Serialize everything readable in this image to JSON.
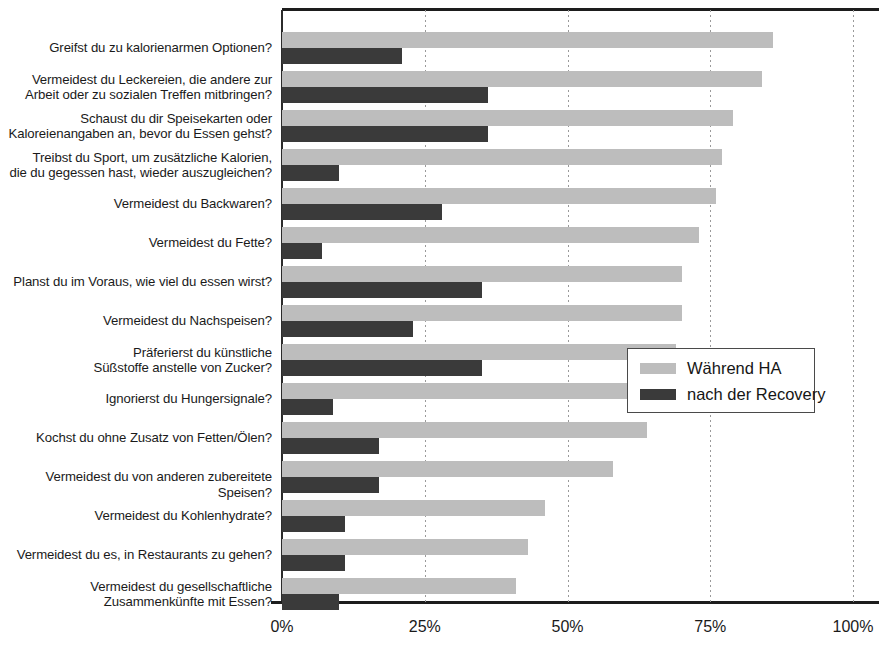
{
  "chart_data": {
    "type": "bar",
    "orientation": "horizontal",
    "title": "",
    "xlabel": "",
    "ylabel": "",
    "xlim": [
      0,
      100
    ],
    "xticks": [
      "0%",
      "25%",
      "50%",
      "75%",
      "100%"
    ],
    "xtick_values": [
      0,
      25,
      50,
      75,
      100
    ],
    "grid": "vertical dotted gridlines at 25%, 50%, 75%, 100%",
    "legend_position": "middle-right, inside plot area",
    "categories": [
      "Greifst du zu kalorienarmen Optionen?",
      "Vermeidest du Leckereien, die andere zur\nArbeit oder zu sozialen Treffen mitbringen?",
      "Schaust du dir Speisekarten oder\nKaloreienangaben an, bevor du Essen gehst?",
      "Treibst du Sport, um zusätzliche Kalorien,\ndie du gegessen hast, wieder auszugleichen?",
      "Vermeidest du Backwaren?",
      "Vermeidest du Fette?",
      "Planst du im Voraus, wie viel du essen wirst?",
      "Vermeidest du Nachspeisen?",
      "Präferierst du künstliche\nSüßstoffe anstelle von Zucker?",
      "Ignorierst du Hungersignale?",
      "Kochst du ohne Zusatz von Fetten/Ölen?",
      "Vermeidest du von anderen zubereitete Speisen?",
      "Vermeidest du Kohlenhydrate?",
      "Vermeidest du es, in Restaurants zu gehen?",
      "Vermeidest du gesellschaftliche\nZusammenkünfte mit Essen?"
    ],
    "series": [
      {
        "name": "Während HA",
        "color": "#bdbdbd",
        "values": [
          86,
          84,
          79,
          77,
          76,
          73,
          70,
          70,
          69,
          66,
          64,
          58,
          46,
          43,
          41
        ]
      },
      {
        "name": "nach der Recovery",
        "color": "#3a3a3a",
        "values": [
          21,
          36,
          36,
          10,
          28,
          7,
          35,
          23,
          35,
          9,
          17,
          17,
          11,
          11,
          10
        ]
      }
    ]
  },
  "legend": {
    "items": [
      {
        "label": "Während HA",
        "swatch": "light"
      },
      {
        "label": "nach der Recovery",
        "swatch": "dark"
      }
    ]
  }
}
